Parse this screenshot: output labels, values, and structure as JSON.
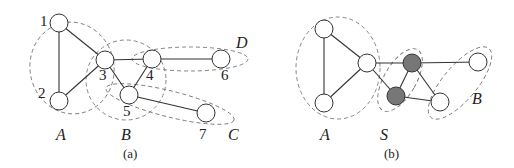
{
  "panels": [
    {
      "caption": "(a)",
      "nodes": [
        {
          "id": "1",
          "label": "1",
          "x": 59,
          "y": 23,
          "lx": 40,
          "ly": 26,
          "fill": "#ffffff"
        },
        {
          "id": "2",
          "label": "2",
          "x": 59,
          "y": 101,
          "lx": 38,
          "ly": 98,
          "fill": "#ffffff"
        },
        {
          "id": "3",
          "label": "3",
          "x": 105,
          "y": 60,
          "lx": 99,
          "ly": 80,
          "fill": "#ffffff"
        },
        {
          "id": "4",
          "label": "4",
          "x": 152,
          "y": 59,
          "lx": 146,
          "ly": 80,
          "fill": "#ffffff"
        },
        {
          "id": "5",
          "label": "5",
          "x": 129,
          "y": 95,
          "lx": 123,
          "ly": 116,
          "fill": "#ffffff"
        },
        {
          "id": "6",
          "label": "6",
          "x": 221,
          "y": 59,
          "lx": 221,
          "ly": 80,
          "fill": "#ffffff"
        },
        {
          "id": "7",
          "label": "7",
          "x": 206,
          "y": 113,
          "lx": 199,
          "ly": 139,
          "fill": "#ffffff"
        }
      ],
      "edges": [
        [
          "1",
          "2"
        ],
        [
          "1",
          "3"
        ],
        [
          "2",
          "3"
        ],
        [
          "3",
          "4"
        ],
        [
          "3",
          "5"
        ],
        [
          "4",
          "5"
        ],
        [
          "4",
          "6"
        ],
        [
          "5",
          "7"
        ]
      ],
      "groups": [
        {
          "label": "A",
          "lx": 56,
          "ly": 140
        },
        {
          "label": "B",
          "lx": 121,
          "ly": 140
        },
        {
          "label": "C",
          "lx": 228,
          "ly": 140
        },
        {
          "label": "D",
          "lx": 236,
          "ly": 48
        }
      ]
    },
    {
      "caption": "(b)",
      "nodes": [
        {
          "id": "a1",
          "x": 324,
          "y": 29,
          "fill": "#ffffff"
        },
        {
          "id": "a2",
          "x": 324,
          "y": 103,
          "fill": "#ffffff"
        },
        {
          "id": "a3",
          "x": 367,
          "y": 63,
          "fill": "#ffffff"
        },
        {
          "id": "s1",
          "x": 412,
          "y": 63,
          "fill": "#777777"
        },
        {
          "id": "s2",
          "x": 396,
          "y": 96,
          "fill": "#777777"
        },
        {
          "id": "b1",
          "x": 440,
          "y": 102,
          "fill": "#ffffff"
        },
        {
          "id": "b2",
          "x": 478,
          "y": 62,
          "fill": "#ffffff"
        }
      ],
      "edges": [
        [
          "a1",
          "a2"
        ],
        [
          "a1",
          "a3"
        ],
        [
          "a2",
          "a3"
        ],
        [
          "a3",
          "s1"
        ],
        [
          "a3",
          "s2"
        ],
        [
          "s1",
          "s2"
        ],
        [
          "s1",
          "b2"
        ],
        [
          "s1",
          "b1"
        ],
        [
          "s2",
          "b1"
        ]
      ],
      "groups": [
        {
          "label": "A",
          "lx": 320,
          "ly": 140
        },
        {
          "label": "S",
          "lx": 380,
          "ly": 140
        },
        {
          "label": "B",
          "lx": 472,
          "ly": 104
        }
      ]
    }
  ]
}
